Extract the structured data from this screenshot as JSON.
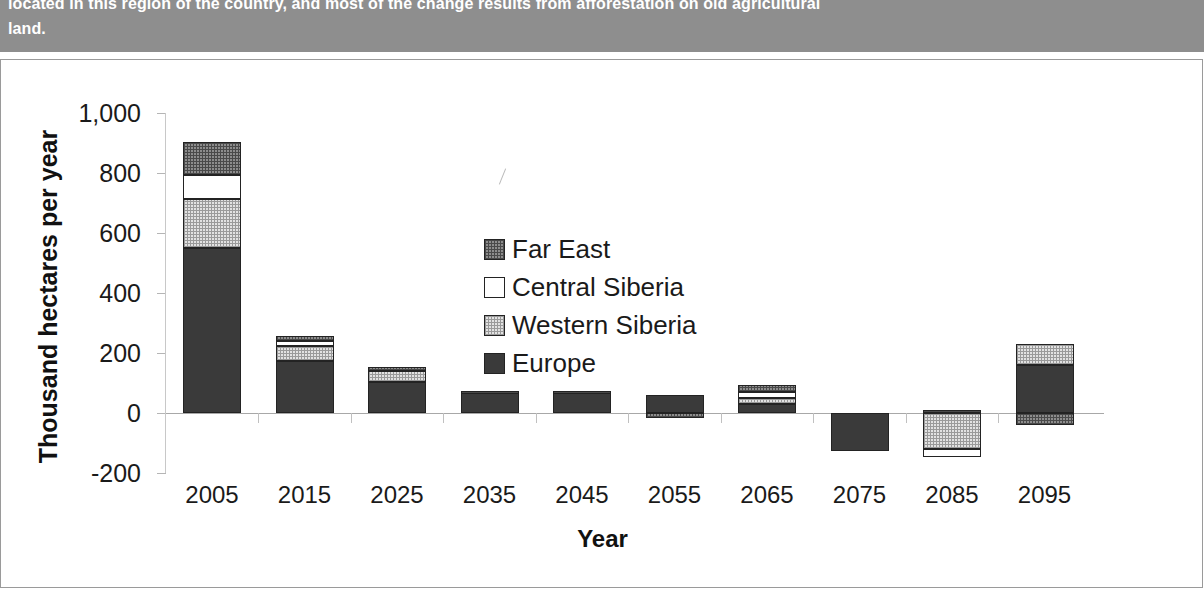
{
  "caption": {
    "line1": "located in this region of the country, and most of the change results from afforestation on old agricultural",
    "line2": "land."
  },
  "chart_data": {
    "type": "bar",
    "subtype": "stacked-bar",
    "title": "",
    "xlabel": "Year",
    "ylabel": "Thousand hectares per year",
    "categories": [
      "2005",
      "2015",
      "2025",
      "2035",
      "2045",
      "2055",
      "2065",
      "2075",
      "2085",
      "2095"
    ],
    "ylim": [
      -200,
      1000
    ],
    "yticks": [
      -200,
      0,
      200,
      400,
      600,
      800,
      1000
    ],
    "ytick_labels": [
      "-200",
      "0",
      "200",
      "400",
      "600",
      "800",
      "1,000"
    ],
    "grid": false,
    "legend_position": "center",
    "series": [
      {
        "name": "Europe",
        "color": "#3a3a3a",
        "pattern": "solid",
        "values": [
          550,
          175,
          105,
          70,
          70,
          60,
          30,
          -125,
          0,
          160
        ]
      },
      {
        "name": "Western Siberia",
        "color": "#e2e2e2",
        "pattern": "fine-dot",
        "values": [
          165,
          50,
          35,
          0,
          0,
          0,
          20,
          0,
          -120,
          70
        ]
      },
      {
        "name": "Central Siberia",
        "color": "#ffffff",
        "pattern": "none",
        "values": [
          80,
          15,
          0,
          0,
          0,
          0,
          20,
          0,
          -25,
          0
        ]
      },
      {
        "name": "Far East",
        "color": "#8d8d8d",
        "pattern": "coarse-dot",
        "values": [
          110,
          17,
          15,
          5,
          5,
          -15,
          25,
          0,
          10,
          -40
        ]
      }
    ]
  },
  "legend": {
    "items": [
      {
        "label": "Far East"
      },
      {
        "label": "Central Siberia"
      },
      {
        "label": "Western Siberia"
      },
      {
        "label": "Europe"
      }
    ]
  }
}
